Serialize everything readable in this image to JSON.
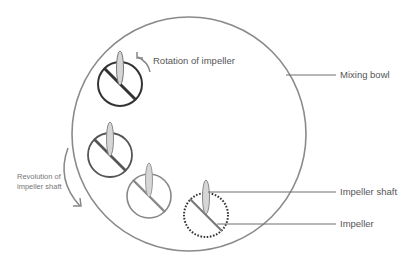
{
  "diagram": {
    "labels": {
      "rotation": "Rotation of impeller",
      "mixing_bowl": "Mixing bowl",
      "revolution_line1": "Revolution of",
      "revolution_line2": "impeller shaft",
      "impeller_shaft": "Impeller shaft",
      "impeller": "Impeller"
    },
    "colors": {
      "bowl": "#8a8a8a",
      "leader": "#6f6f6f",
      "impeller_dark": "#3a3a3a",
      "impeller_mid": "#666666",
      "impeller_light": "#8c8c8c",
      "shaft_fill": "#d6d6d6",
      "text": "#555555"
    }
  }
}
